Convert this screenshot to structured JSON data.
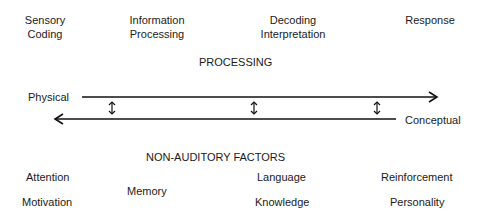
{
  "stages": [
    {
      "line1": "Sensory",
      "line2": "Coding"
    },
    {
      "line1": "Information",
      "line2": "Processing"
    },
    {
      "line1": "Decoding",
      "line2": "Interpretation"
    },
    {
      "line1": "Response",
      "line2": ""
    }
  ],
  "processing_label": "PROCESSING",
  "axis": {
    "left_label": "Physical",
    "right_label": "Conceptual"
  },
  "factors_label": "NON-AUDITORY FACTORS",
  "factors": {
    "attention": "Attention",
    "motivation": "Motivation",
    "memory": "Memory",
    "language": "Language",
    "knowledge": "Knowledge",
    "reinforcement": "Reinforcement",
    "personality": "Personality"
  }
}
